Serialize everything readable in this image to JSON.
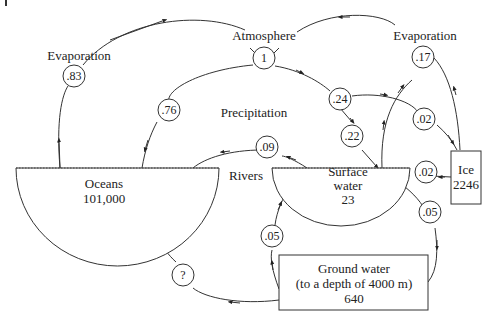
{
  "reservoirs": {
    "atmosphere": {
      "label": "Atmosphere",
      "value": "1"
    },
    "oceans": {
      "label": "Oceans",
      "value": "101,000"
    },
    "surface_water": {
      "label1": "Surface",
      "label2": "water",
      "value": "23"
    },
    "ice": {
      "label": "Ice",
      "value": "2246"
    },
    "ground_water": {
      "label": "Ground water",
      "sub": "(to a depth of 4000 m)",
      "value": "640"
    }
  },
  "process_labels": {
    "evaporation_left": "Evaporation",
    "evaporation_right": "Evaporation",
    "precipitation": "Precipitation",
    "rivers": "Rivers"
  },
  "fluxes": {
    "ocean_evap": ".83",
    "precip_ocean": ".76",
    "precip_land": ".24",
    "precip_surface": ".22",
    "precip_ice": ".02",
    "land_evap": ".17",
    "rivers": ".09",
    "ice_melt": ".02",
    "surface_to_ground": ".05",
    "ground_to_surface": ".05",
    "ground_to_ocean": "?"
  }
}
